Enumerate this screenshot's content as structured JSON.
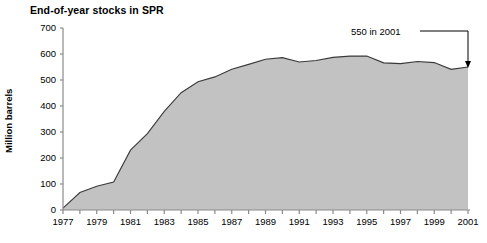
{
  "chart_data": {
    "type": "area",
    "title": "End-of-year stocks in SPR",
    "xlabel": "",
    "ylabel": "Million barrels",
    "xlim": [
      1977,
      2001
    ],
    "ylim": [
      0,
      700
    ],
    "yticks": [
      0,
      100,
      200,
      300,
      400,
      500,
      600,
      700
    ],
    "ytick_labels": [
      "0",
      "100",
      "200",
      "300",
      "400",
      "500",
      "600",
      "700"
    ],
    "xticks": [
      1977,
      1978,
      1979,
      1980,
      1981,
      1982,
      1983,
      1984,
      1985,
      1986,
      1987,
      1988,
      1989,
      1990,
      1991,
      1992,
      1993,
      1994,
      1995,
      1996,
      1997,
      1998,
      1999,
      2000,
      2001
    ],
    "xtick_labels": [
      "1977",
      "1979",
      "1981",
      "1983",
      "1985",
      "1987",
      "1989",
      "1991",
      "1993",
      "1995",
      "1997",
      "1999",
      "2001"
    ],
    "xtick_labels_years": [
      1977,
      1979,
      1981,
      1983,
      1985,
      1987,
      1989,
      1991,
      1993,
      1995,
      1997,
      1999,
      2001
    ],
    "grid": false,
    "legend": false,
    "x": [
      1977,
      1978,
      1979,
      1980,
      1981,
      1982,
      1983,
      1984,
      1985,
      1986,
      1987,
      1988,
      1989,
      1990,
      1991,
      1992,
      1993,
      1994,
      1995,
      1996,
      1997,
      1998,
      1999,
      2000,
      2001
    ],
    "values": [
      7,
      67,
      91,
      108,
      230,
      294,
      379,
      451,
      493,
      512,
      541,
      560,
      580,
      586,
      569,
      575,
      587,
      592,
      592,
      566,
      563,
      571,
      567,
      541,
      550
    ],
    "series": [
      {
        "name": "End-of-year stocks in SPR",
        "values": [
          7,
          67,
          91,
          108,
          230,
          294,
          379,
          451,
          493,
          512,
          541,
          560,
          580,
          586,
          569,
          575,
          587,
          592,
          592,
          566,
          563,
          571,
          567,
          541,
          550
        ]
      }
    ],
    "annotations": [
      {
        "text": "550 in 2001",
        "x": 2001,
        "y": 550
      }
    ],
    "colors": {
      "area_fill": "#c2c2c2",
      "line": "#3a3a3a",
      "axis": "#8a8a8a",
      "text": "#000000"
    }
  }
}
